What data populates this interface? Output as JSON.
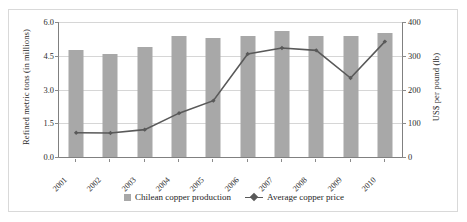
{
  "chart_data": {
    "type": "bar",
    "title": "",
    "subtitle": "",
    "categories": [
      "2001",
      "2002",
      "2003",
      "2004",
      "2005",
      "2006",
      "2007",
      "2008",
      "2009",
      "2010"
    ],
    "series": [
      {
        "name": "Chilean copper production",
        "kind": "bar",
        "axis": "left",
        "unit": "refined metric tons (in millions)",
        "color": "#a8a8a8",
        "values": [
          4.75,
          4.6,
          4.9,
          5.4,
          5.3,
          5.4,
          5.6,
          5.4,
          5.4,
          5.5
        ]
      },
      {
        "name": "Average copper price",
        "kind": "line",
        "axis": "right",
        "unit": "US$ per pound (lb)",
        "color": "#595959",
        "marker": "diamond",
        "values": [
          72,
          71,
          81,
          130,
          167,
          305,
          323,
          316,
          234,
          342
        ]
      }
    ],
    "xlabel": "",
    "ylabel": "Refined metric tons (in millions)",
    "y2label": "US$ per pound (lb)",
    "yticks": [
      "0.0",
      "1.5",
      "3.0",
      "4.5",
      "6.0"
    ],
    "ytick_values": [
      0.0,
      1.5,
      3.0,
      4.5,
      6.0
    ],
    "ylim": [
      0.0,
      6.0
    ],
    "y2ticks": [
      "0",
      "100",
      "200",
      "300",
      "400"
    ],
    "y2tick_values": [
      0,
      100,
      200,
      300,
      400
    ],
    "y2lim": [
      0,
      400
    ],
    "grid": "horizontal",
    "legend_position": "bottom",
    "legend": [
      "Chilean copper production",
      "Average copper price"
    ]
  },
  "axes": {
    "left_title": "Refined metric tons (in millions)",
    "right_title": "US$ per pound (lb)"
  },
  "legend": {
    "entries": [
      {
        "label": "Chilean copper production",
        "marker": "square-swatch-icon"
      },
      {
        "label": "Average copper price",
        "marker": "line-diamond-marker-icon"
      }
    ]
  }
}
